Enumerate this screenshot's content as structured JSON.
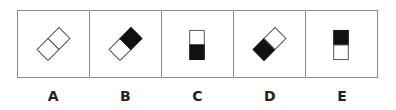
{
  "options": [
    {
      "label": "A",
      "figure": "diagonal-domino-empty",
      "top_fill": "#ffffff",
      "bottom_fill": "#ffffff"
    },
    {
      "label": "B",
      "figure": "diagonal-domino-bottom-filled",
      "top_fill": "#ffffff",
      "bottom_fill": "#111111"
    },
    {
      "label": "C",
      "figure": "vertical-domino-bottom-filled",
      "top_fill": "#ffffff",
      "bottom_fill": "#111111"
    },
    {
      "label": "D",
      "figure": "diagonal-domino-top-filled",
      "top_fill": "#111111",
      "bottom_fill": "#ffffff"
    },
    {
      "label": "E",
      "figure": "vertical-domino-top-filled",
      "top_fill": "#111111",
      "bottom_fill": "#ffffff"
    }
  ]
}
